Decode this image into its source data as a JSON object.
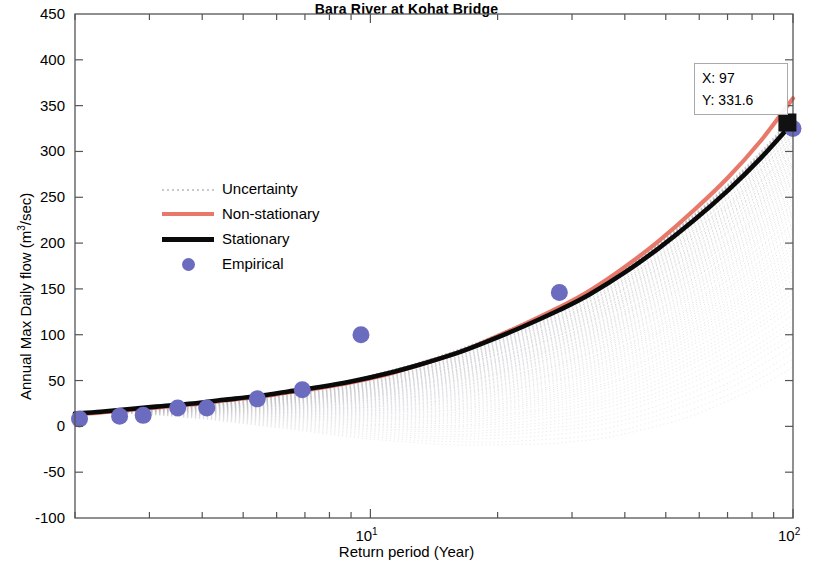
{
  "chart_data": {
    "type": "line",
    "title": "Bara River at Kohat Bridge",
    "xlabel": "Return period (Year)",
    "ylabel": "Annual Max  Daily flow (m³/sec)",
    "ylabel_parts": {
      "pre": "Annual Max  Daily flow (m",
      "sup": "3",
      "post": "/sec)"
    },
    "xscale": "log",
    "xlim": [
      2,
      100
    ],
    "ylim": [
      -100,
      450
    ],
    "yticks": [
      450,
      400,
      350,
      300,
      250,
      200,
      150,
      100,
      50,
      0,
      -50,
      -100
    ],
    "xticks": [
      10,
      100
    ],
    "xtick_labels": [
      {
        "base": "10",
        "exp": "1",
        "value": 10
      },
      {
        "base": "10",
        "exp": "2",
        "value": 100
      }
    ],
    "grid": false,
    "legend_position": "center-left",
    "legend": [
      {
        "label": "Uncertainty",
        "style": "dotted-line",
        "color": "#c9c9c9"
      },
      {
        "label": "Non-stationary",
        "style": "solid-line",
        "color": "#e8796a"
      },
      {
        "label": "Stationary",
        "style": "solid-line",
        "color": "#0a0a0a"
      },
      {
        "label": "Empirical",
        "style": "marker-circle",
        "color": "#6b6bc0"
      }
    ],
    "series": [
      {
        "name": "Stationary",
        "color": "#0a0a0a",
        "type": "line",
        "x": [
          2,
          2.3,
          2.7,
          3.2,
          3.8,
          4.5,
          5.4,
          6.4,
          7.6,
          9,
          11,
          13,
          16,
          19,
          23,
          28,
          33,
          40,
          48,
          58,
          70,
          84,
          100
        ],
        "y": [
          14,
          16,
          19,
          22,
          25,
          29,
          33,
          38,
          43,
          49,
          58,
          67,
          80,
          93,
          109,
          127,
          144,
          168,
          194,
          224,
          257,
          293,
          331.6
        ]
      },
      {
        "name": "Non-stationary",
        "color": "#e8796a",
        "type": "line",
        "x": [
          2,
          2.3,
          2.7,
          3.2,
          3.8,
          4.5,
          5.4,
          6.4,
          7.6,
          9,
          11,
          13,
          16,
          19,
          23,
          28,
          33,
          40,
          48,
          58,
          70,
          84,
          100
        ],
        "y": [
          13,
          15,
          18,
          21,
          24,
          28,
          32,
          37,
          42,
          48,
          57,
          67,
          80,
          94,
          111,
          130,
          148,
          174,
          202,
          235,
          271,
          312,
          358
        ]
      },
      {
        "name": "Empirical",
        "color": "#6b6bc0",
        "type": "scatter",
        "x": [
          2.05,
          2.55,
          2.9,
          3.5,
          4.1,
          5.4,
          6.9,
          9.5,
          28,
          100
        ],
        "y": [
          8,
          11,
          12,
          20,
          20,
          30,
          40,
          100,
          146,
          325
        ]
      }
    ],
    "uncertainty": {
      "name": "Uncertainty",
      "color": "#c9c9c9",
      "description": "Dense fan of dotted gray ensemble traces widening toward long return periods",
      "x_start": 2,
      "x_end": 100,
      "upper_at_100": 340,
      "lower_at_100": 60,
      "upper_at_10": 56,
      "lower_at_10": 40
    },
    "datatip": {
      "x_label": "X: 97",
      "y_label": "Y: 331.6",
      "x_value": 97,
      "y_value": 331.6,
      "marker": "black-square"
    }
  }
}
